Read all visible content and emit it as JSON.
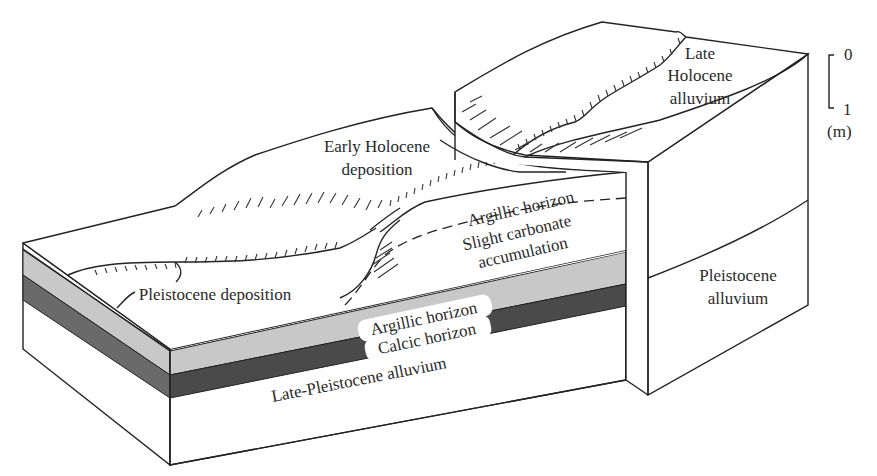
{
  "figure": {
    "type": "block-diagram"
  },
  "colors": {
    "argillic_band": "#c8c8c8",
    "calcic_band": "#4a4a4a",
    "outline": "#222222",
    "background": "#ffffff"
  },
  "labels": {
    "early_holocene_1": "Early Holocene",
    "early_holocene_2": "deposition",
    "late_holocene_1": "Late",
    "late_holocene_2": "Holocene",
    "late_holocene_3": "alluvium",
    "argillic_upper": "Argillic horizon",
    "slight_carbonate_1": "Slight carbonate",
    "slight_carbonate_2": "accumulation",
    "pleistocene_deposition": "Pleistocene deposition",
    "argillic_lower": "Argillic horizon",
    "calcic": "Calcic horizon",
    "late_pleistocene": "Late-Pleistocene alluvium",
    "pleistocene_alluvium_1": "Pleistocene",
    "pleistocene_alluvium_2": "alluvium"
  },
  "scale_bar": {
    "top": "0",
    "bottom": "1",
    "unit": "(m)"
  }
}
